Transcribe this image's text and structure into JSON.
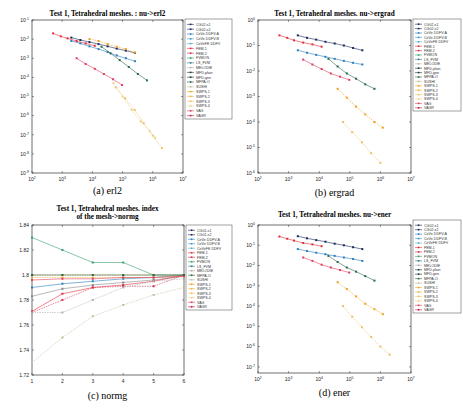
{
  "figure": {
    "panels": [
      {
        "id": "a",
        "title": "Test 1, Tetrahedral meshes.  : nu->erl2",
        "caption": "(a)  erl2"
      },
      {
        "id": "b",
        "title": "Test 1, Tetrahedral meshes.  nu->ergrad",
        "caption": "(b)  ergrad"
      },
      {
        "id": "c",
        "title": "Test 1, Tetrahedral meshes. index",
        "title2": "of the mesh->normg",
        "caption": "(c)  normg"
      },
      {
        "id": "d",
        "title": "Test 1, Tetrahedral meshes.  nu->ener",
        "caption": "(d)  ener"
      }
    ]
  },
  "legend_full": [
    "CG02-s1",
    "CG02-s2",
    "CeVe DDFV-A",
    "CeVe DDFV-B",
    "CeVeFE DDFV",
    "FEM-1",
    "FEM-2",
    "FVMON",
    "LS_FVM",
    "MELODIE",
    "MFD-plain",
    "MFD-gen",
    "MFPA-O",
    "SUSHI",
    "SWPS-1",
    "SWPS-2",
    "SWPS-3",
    "SWPS-4",
    "VAG",
    "VAGR"
  ],
  "legend_c": [
    "CG01-s1",
    "CG01-s2",
    "CeVe DDFV-A",
    "CeVe DDFV-B",
    "CeVeFE DDFV",
    "FEM-1",
    "FEM-2",
    "FVMON",
    "LS_FVM",
    "MELODIE",
    "MFPA-O",
    "SUSHI",
    "SWPS-1",
    "SWPS-2",
    "SWPS-3",
    "SWPS-4",
    "VAG",
    "VAGR"
  ],
  "colors": {
    "CG02-s1": "#1a2a5a",
    "CG02-s2": "#1a2a5a",
    "CeVe DDFV-A": "#2a7fc0",
    "CeVe DDFV-B": "#3a9ad0",
    "CeVeFE DDFV": "#5aaad0",
    "FEM-1": "#e0303a",
    "FEM-2": "#d03050",
    "FVMON": "#3aa070",
    "LS_FVM": "#2a7a8a",
    "MELODIE": "#b0b0b0",
    "MFD-plain": "#1a3a3a",
    "MFD-gen": "#1a3a3a",
    "MFPA-O": "#2a6a4a",
    "SUSHI": "#c0c0a0",
    "SWPS-1": "#f0a020",
    "SWPS-2": "#f0b040",
    "SWPS-3": "#f0c060",
    "SWPS-4": "#f0d080",
    "VAG": "#e04060",
    "VAGR": "#c02040"
  },
  "chart_data": [
    {
      "type": "line",
      "title": "Test 1, Tetrahedral meshes.  : nu->erl2",
      "xlabel": "nu",
      "ylabel": "erl2",
      "xscale": "log",
      "yscale": "log",
      "xlim": [
        100,
        10000000
      ],
      "ylim": [
        1e-09,
        0.1
      ],
      "xticks": [
        "10^2",
        "10^3",
        "10^4",
        "10^5",
        "10^6",
        "10^7"
      ],
      "yticks": [
        "10^-1",
        "10^-2",
        "10^-3",
        "10^-4",
        "10^-5",
        "10^-6",
        "10^-7",
        "10^-8",
        "10^-9"
      ],
      "series": [
        {
          "name": "CG02-s1",
          "x": [
            2000,
            4000,
            8000,
            16000,
            32000,
            64000,
            128000,
            256000
          ],
          "y": [
            0.012,
            0.009,
            0.007,
            0.0055,
            0.0042,
            0.0032,
            0.0025,
            0.0019
          ]
        },
        {
          "name": "CeVe DDFV-A",
          "x": [
            2000,
            4000,
            8000,
            16000,
            32000,
            64000,
            128000,
            256000
          ],
          "y": [
            0.008,
            0.006,
            0.0042,
            0.003,
            0.0021,
            0.0014,
            0.001,
            0.0007
          ]
        },
        {
          "name": "FEM-1",
          "x": [
            500,
            900,
            1500,
            3000,
            6000,
            12000
          ],
          "y": [
            0.02,
            0.014,
            0.011,
            0.008,
            0.006,
            0.0045
          ]
        },
        {
          "name": "VAG",
          "x": [
            3000,
            6000,
            12000,
            24000,
            48000,
            96000
          ],
          "y": [
            0.001,
            0.0005,
            0.00028,
            0.00015,
            8e-05,
            4e-05
          ]
        },
        {
          "name": "SWPS-1",
          "x": [
            8000,
            16000,
            32000,
            64000,
            128000,
            256000
          ],
          "y": [
            0.01,
            0.008,
            0.0055,
            0.004,
            0.003,
            0.002
          ]
        },
        {
          "name": "MFPA-O",
          "x": [
            20000,
            40000,
            80000,
            160000,
            320000,
            640000
          ],
          "y": [
            0.004,
            0.0018,
            0.0008,
            0.00035,
            0.00015,
            7e-05
          ]
        },
        {
          "name": "SWPS-3",
          "x": [
            60000,
            120000,
            250000,
            500000,
            1000000,
            2000000
          ],
          "y": [
            3e-05,
            8e-06,
            2e-06,
            4e-07,
            9e-08,
            2e-08
          ]
        },
        {
          "name": "SWPS-4",
          "x": [
            50000,
            100000,
            200000,
            400000,
            800000,
            1200000
          ],
          "y": [
            5e-05,
            1e-05,
            2e-06,
            5e-07,
            1.5e-07,
            7e-08
          ]
        }
      ],
      "legend_position": "right-outside"
    },
    {
      "type": "line",
      "title": "Test 1, Tetrahedral meshes.  nu->ergrad",
      "xlabel": "nu",
      "ylabel": "ergrad",
      "xscale": "log",
      "yscale": "log",
      "xlim": [
        100,
        10000000
      ],
      "ylim": [
        1e-06,
        1
      ],
      "xticks": [
        "10^2",
        "10^3",
        "10^4",
        "10^5",
        "10^6",
        "10^7"
      ],
      "yticks": [
        "10^0",
        "10^-1",
        "10^-2",
        "10^-3",
        "10^-4",
        "10^-5",
        "10^-6"
      ],
      "series": [
        {
          "name": "CG02-s1",
          "x": [
            2000,
            4000,
            8000,
            16000,
            32000,
            64000,
            128000,
            256000
          ],
          "y": [
            0.25,
            0.2,
            0.17,
            0.14,
            0.12,
            0.1,
            0.08,
            0.065
          ]
        },
        {
          "name": "CeVe DDFV-A",
          "x": [
            2000,
            4000,
            8000,
            16000,
            32000,
            64000,
            128000,
            256000
          ],
          "y": [
            0.065,
            0.052,
            0.043,
            0.036,
            0.03,
            0.025,
            0.021,
            0.018
          ]
        },
        {
          "name": "FEM-1",
          "x": [
            500,
            900,
            1500,
            3000,
            6000,
            12000
          ],
          "y": [
            0.25,
            0.2,
            0.16,
            0.13,
            0.11,
            0.09
          ]
        },
        {
          "name": "VAG",
          "x": [
            3000,
            6000,
            12000,
            24000,
            48000,
            96000
          ],
          "y": [
            0.028,
            0.018,
            0.012,
            0.008,
            0.006,
            0.0045
          ]
        },
        {
          "name": "MFPA-O",
          "x": [
            20000,
            40000,
            80000,
            160000,
            320000,
            640000
          ],
          "y": [
            0.03,
            0.015,
            0.008,
            0.005,
            0.003,
            0.002
          ]
        },
        {
          "name": "SWPS-1",
          "x": [
            40000,
            80000,
            160000,
            320000,
            640000,
            1200000
          ],
          "y": [
            0.002,
            0.0009,
            0.0004,
            0.0002,
            0.0001,
            6e-05
          ]
        },
        {
          "name": "SWPS-3",
          "x": [
            60000,
            120000,
            250000,
            500000,
            1000000
          ],
          "y": [
            0.0001,
            4e-05,
            1.6e-05,
            6e-06,
            2.5e-06
          ]
        }
      ],
      "legend_position": "right-outside"
    },
    {
      "type": "line",
      "title": "Test 1, Tetrahedral meshes. index of the mesh->normg",
      "xlabel": "index of the mesh",
      "ylabel": "normg",
      "xlim": [
        1,
        6
      ],
      "ylim": [
        1.72,
        1.84
      ],
      "xticks": [
        "1",
        "2",
        "3",
        "4",
        "5",
        "6"
      ],
      "yticks": [
        "1.72",
        "1.74",
        "1.76",
        "1.78",
        "1.8",
        "1.82",
        "1.84"
      ],
      "series": [
        {
          "name": "FVMON",
          "x": [
            1,
            2,
            3,
            4,
            5,
            6
          ],
          "y": [
            1.83,
            1.82,
            1.81,
            1.81,
            1.8,
            1.8
          ]
        },
        {
          "name": "CG01-s1",
          "x": [
            1,
            2,
            3,
            4,
            5,
            6
          ],
          "y": [
            1.783,
            1.789,
            1.792,
            1.794,
            1.796,
            1.799
          ]
        },
        {
          "name": "CeVe DDFV-A",
          "x": [
            1,
            2,
            3,
            4,
            5,
            6
          ],
          "y": [
            1.79,
            1.793,
            1.795,
            1.797,
            1.798,
            1.8
          ]
        },
        {
          "name": "FEM-1",
          "x": [
            1,
            2,
            3,
            4,
            5,
            6
          ],
          "y": [
            1.771,
            1.785,
            1.79,
            1.792,
            1.795,
            1.8
          ]
        },
        {
          "name": "FEM-2",
          "x": [
            1,
            2,
            3,
            4,
            5,
            6
          ],
          "y": [
            1.77,
            1.78,
            1.79,
            1.791,
            1.791,
            1.8
          ]
        },
        {
          "name": "SUSHI",
          "x": [
            1,
            2,
            3,
            4,
            5,
            6
          ],
          "y": [
            1.73,
            1.75,
            1.767,
            1.776,
            1.784,
            1.79
          ]
        },
        {
          "name": "MELODIE",
          "x": [
            1,
            2,
            3,
            4,
            5,
            6
          ],
          "y": [
            1.77,
            1.77,
            1.78,
            1.79,
            1.795,
            1.797
          ]
        },
        {
          "name": "SWPS-1",
          "x": [
            1,
            2,
            3,
            4,
            5,
            6
          ],
          "y": [
            1.8,
            1.8,
            1.8,
            1.8,
            1.8,
            1.8
          ]
        },
        {
          "name": "SWPS-2",
          "x": [
            1,
            2,
            3,
            4,
            5,
            6
          ],
          "y": [
            1.798,
            1.798,
            1.798,
            1.798,
            1.798,
            1.799
          ]
        },
        {
          "name": "VAG",
          "x": [
            1,
            2,
            3,
            4,
            5,
            6
          ],
          "y": [
            1.796,
            1.797,
            1.797,
            1.798,
            1.798,
            1.799
          ]
        },
        {
          "name": "MFPA-O",
          "x": [
            1,
            2,
            3,
            4,
            5,
            6
          ],
          "y": [
            1.8,
            1.8,
            1.8,
            1.8,
            1.8,
            1.8
          ]
        }
      ],
      "legend_position": "right-outside"
    },
    {
      "type": "line",
      "title": "Test 1, Tetrahedral meshes.  nu->ener",
      "xlabel": "nu",
      "ylabel": "ener",
      "xscale": "log",
      "yscale": "log",
      "xlim": [
        100,
        10000000
      ],
      "ylim": [
        5e-08,
        1
      ],
      "xticks": [
        "10^2",
        "10^3",
        "10^4",
        "10^5",
        "10^6",
        "10^7"
      ],
      "yticks": [
        "10^0",
        "10^-1",
        "10^-2",
        "10^-3",
        "10^-4",
        "10^-5",
        "10^-6",
        "10^-7"
      ],
      "series": [
        {
          "name": "CG02-s1",
          "x": [
            2000,
            4000,
            8000,
            16000,
            32000,
            64000,
            128000,
            256000
          ],
          "y": [
            0.28,
            0.22,
            0.18,
            0.15,
            0.12,
            0.1,
            0.08,
            0.065
          ]
        },
        {
          "name": "CeVe DDFV-A",
          "x": [
            2000,
            4000,
            8000,
            16000,
            32000,
            64000,
            128000,
            256000
          ],
          "y": [
            0.065,
            0.052,
            0.043,
            0.036,
            0.03,
            0.025,
            0.021,
            0.017
          ]
        },
        {
          "name": "FEM-1",
          "x": [
            500,
            900,
            1500,
            3000,
            6000,
            12000
          ],
          "y": [
            0.27,
            0.21,
            0.17,
            0.13,
            0.11,
            0.09
          ]
        },
        {
          "name": "VAG",
          "x": [
            3000,
            6000,
            12000,
            24000,
            48000,
            96000
          ],
          "y": [
            0.025,
            0.017,
            0.011,
            0.008,
            0.006,
            0.0045
          ]
        },
        {
          "name": "MFPA-O",
          "x": [
            20000,
            40000,
            80000,
            160000,
            320000,
            640000
          ],
          "y": [
            0.03,
            0.015,
            0.008,
            0.005,
            0.003,
            0.0018
          ]
        },
        {
          "name": "SWPS-1",
          "x": [
            40000,
            80000,
            160000,
            320000,
            640000,
            1200000
          ],
          "y": [
            0.0015,
            0.0007,
            0.0003,
            0.00013,
            7e-05,
            4e-05
          ]
        },
        {
          "name": "SWPS-3",
          "x": [
            60000,
            120000,
            250000,
            500000,
            1000000,
            2000000
          ],
          "y": [
            0.0001,
            3e-05,
            9e-06,
            3e-06,
            1e-06,
            4e-07
          ]
        }
      ],
      "legend_position": "right-outside"
    }
  ]
}
